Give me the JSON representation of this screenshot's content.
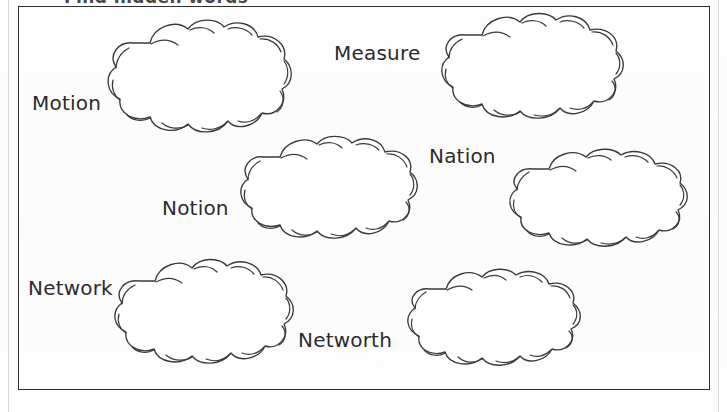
{
  "page": {
    "title": "Find hidden words",
    "background_color": "#fdfdfd",
    "ink_color": "#2f2f2f",
    "width": 727,
    "height": 412
  },
  "activity": {
    "type": "word-search-clouds-worksheet",
    "border_color": "#2f2f2f",
    "cloud_count": 6,
    "word_count": 6
  },
  "words": [
    {
      "id": "motion",
      "label": "Motion"
    },
    {
      "id": "measure",
      "label": "Measure"
    },
    {
      "id": "nation",
      "label": "Nation"
    },
    {
      "id": "notion",
      "label": "Notion"
    },
    {
      "id": "network",
      "label": "Network"
    },
    {
      "id": "networth",
      "label": "Networth"
    }
  ],
  "clouds": [
    {
      "id": "cloud-1",
      "position": "top-left"
    },
    {
      "id": "cloud-2",
      "position": "top-right"
    },
    {
      "id": "cloud-3",
      "position": "middle-left"
    },
    {
      "id": "cloud-4",
      "position": "middle-right"
    },
    {
      "id": "cloud-5",
      "position": "bottom-left"
    },
    {
      "id": "cloud-6",
      "position": "bottom-right"
    }
  ]
}
